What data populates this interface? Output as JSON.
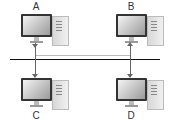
{
  "diagram": {
    "type": "bus-network",
    "nodes": [
      {
        "id": "A",
        "label": "A",
        "position": "top-left"
      },
      {
        "id": "B",
        "label": "B",
        "position": "top-right"
      },
      {
        "id": "C",
        "label": "C",
        "position": "bottom-left"
      },
      {
        "id": "D",
        "label": "D",
        "position": "bottom-right"
      }
    ],
    "edges": [
      {
        "from": "A",
        "to": "C",
        "style": "arrow",
        "via": "bus"
      },
      {
        "from": "D",
        "to": "B",
        "style": "arrow",
        "via": "bus"
      },
      {
        "from": "A",
        "to": "B",
        "style": "light-line"
      }
    ],
    "bus_color": "#111111",
    "arrow_color": "#666666"
  }
}
